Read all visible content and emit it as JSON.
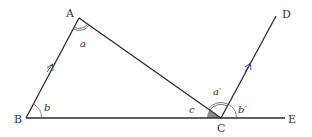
{
  "diagram": {
    "points": {
      "A": {
        "label": "A",
        "x": 79,
        "y": 18
      },
      "B": {
        "label": "B",
        "x": 26,
        "y": 118
      },
      "C": {
        "label": "C",
        "x": 221,
        "y": 118
      },
      "D": {
        "label": "D",
        "x": 276,
        "y": 16
      },
      "E": {
        "label": "E",
        "x": 285,
        "y": 118
      }
    },
    "segments": [
      {
        "from": "A",
        "to": "B",
        "parallel_mark": true
      },
      {
        "from": "A",
        "to": "C",
        "parallel_mark": false
      },
      {
        "from": "B",
        "to": "E",
        "parallel_mark": false
      },
      {
        "from": "C",
        "to": "D",
        "parallel_mark": true
      }
    ],
    "angles": {
      "a": {
        "label": "a",
        "vertex": "A",
        "marker": "double-arc"
      },
      "b": {
        "label": "b",
        "vertex": "B",
        "marker": "single-arc"
      },
      "c": {
        "label": "c",
        "vertex": "C",
        "marker": "shaded-sector"
      },
      "a_prime": {
        "label": "a′",
        "vertex": "C",
        "marker": "double-arc"
      },
      "b_prime": {
        "label": "b′",
        "vertex": "C",
        "marker": "single-arc"
      }
    },
    "colors": {
      "line": "#2b2b2b",
      "arrow": "#3a4fa0",
      "shade": "#8a8a8a",
      "arc": "#555555"
    }
  }
}
